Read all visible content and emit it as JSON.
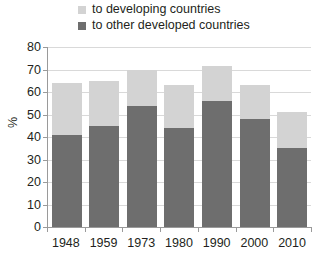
{
  "chart_data": {
    "type": "bar",
    "stacked": true,
    "title": "",
    "xlabel": "",
    "ylabel": "%",
    "ylim": [
      0,
      80
    ],
    "yticks": [
      80,
      70,
      60,
      50,
      40,
      30,
      20,
      10,
      0
    ],
    "grid": true,
    "legend_position": "top",
    "categories": [
      "1948",
      "1959",
      "1973",
      "1980",
      "1990",
      "2000",
      "2010"
    ],
    "series": [
      {
        "name": "to other developed countries",
        "color": "#6e6e6e",
        "values": [
          41,
          45,
          54,
          44,
          56,
          48,
          35
        ]
      },
      {
        "name": "to developing countries",
        "color": "#d3d3d3",
        "values": [
          23,
          20,
          16,
          19,
          15.5,
          15,
          16
        ]
      }
    ],
    "totals": [
      64,
      65,
      70,
      63,
      71.5,
      63,
      51
    ]
  },
  "legend": {
    "items": [
      {
        "label": "to developing countries",
        "color": "#d3d3d3"
      },
      {
        "label": "to other developed countries",
        "color": "#6e6e6e"
      }
    ]
  },
  "axes": {
    "y_title": "%",
    "y_tick_labels": [
      "80",
      "70",
      "60",
      "50",
      "40",
      "30",
      "20",
      "10",
      "0"
    ],
    "x_tick_labels": [
      "1948",
      "1959",
      "1973",
      "1980",
      "1990",
      "2000",
      "2010"
    ]
  },
  "colors": {
    "developing": "#d3d3d3",
    "developed": "#6e6e6e",
    "grid": "#d9d9d9",
    "axis": "#9a9a9a",
    "text": "#231f20",
    "background": "#ffffff"
  }
}
